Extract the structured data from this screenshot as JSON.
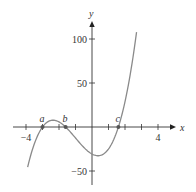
{
  "chart_data": {
    "type": "line",
    "title": "",
    "xlabel": "x",
    "ylabel": "y",
    "xlim": [
      -4.5,
      5.5
    ],
    "ylim": [
      -60,
      120
    ],
    "x_ticks": [
      -4,
      -3,
      -2,
      -1,
      1,
      2,
      3,
      4
    ],
    "x_tick_labels": [
      {
        "value": -4,
        "label": "−4"
      },
      {
        "value": 4,
        "label": "4"
      }
    ],
    "y_ticks": [
      -50,
      50,
      100
    ],
    "y_tick_labels": [
      {
        "value": 100,
        "label": "100"
      },
      {
        "value": 50,
        "label": "50"
      },
      {
        "value": -50,
        "label": "−50"
      }
    ],
    "grid": false,
    "legend": null,
    "series": [
      {
        "name": "f(x)",
        "description": "cubic with roots at a, b, c",
        "x": [
          -3.9,
          -3.5,
          -3.0,
          -2.5,
          -2.3,
          -2.0,
          -1.6,
          -1.0,
          -0.5,
          0.0,
          0.5,
          1.0,
          1.6,
          2.0,
          2.4,
          2.7
        ],
        "y": [
          -45.5,
          -17.1,
          0,
          7.2,
          7.3,
          5.4,
          0,
          -6.2,
          -17.0,
          -30.7,
          -36.1,
          -34.6,
          0,
          24.4,
          67.0,
          107.8
        ]
      }
    ],
    "annotations": [
      {
        "label": "a",
        "x": -3.0,
        "y": 0
      },
      {
        "label": "b",
        "x": -1.6,
        "y": 0
      },
      {
        "label": "c",
        "x": 1.6,
        "y": 0
      }
    ]
  },
  "axes": {
    "x_axis_label": "x",
    "y_axis_label": "y"
  },
  "colors": {
    "curve": "#8a8a8a",
    "axis": "#333333",
    "point": "#555555"
  }
}
